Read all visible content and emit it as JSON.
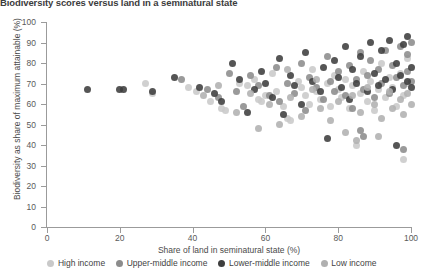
{
  "chart_data": {
    "type": "scatter",
    "title": "Biodiversity scores versus land in a seminatural state",
    "xlabel": "Share of land in seminatural state (%)",
    "ylabel": "Biodiversity as share of maximum attainable (%)",
    "xlim": [
      0,
      100
    ],
    "ylim": [
      0,
      100
    ],
    "xticks": [
      0,
      20,
      40,
      60,
      80,
      100
    ],
    "yticks": [
      0,
      10,
      20,
      30,
      40,
      50,
      60,
      70,
      80,
      90,
      100
    ],
    "grid": false,
    "legend_position": "bottom",
    "series": [
      {
        "name": "High income",
        "color": "#c9c9c9",
        "points": [
          [
            27,
            70
          ],
          [
            29,
            65
          ],
          [
            39,
            68
          ],
          [
            41,
            66
          ],
          [
            45,
            61
          ],
          [
            48,
            58
          ],
          [
            49,
            57
          ],
          [
            53,
            70
          ],
          [
            55,
            69
          ],
          [
            57,
            72
          ],
          [
            58,
            62
          ],
          [
            59,
            61
          ],
          [
            60,
            64
          ],
          [
            62,
            75
          ],
          [
            63,
            66
          ],
          [
            65,
            59
          ],
          [
            66,
            53
          ],
          [
            67,
            52
          ],
          [
            69,
            71
          ],
          [
            70,
            68
          ],
          [
            71,
            64
          ],
          [
            72,
            60
          ],
          [
            73,
            77
          ],
          [
            74,
            66
          ],
          [
            75,
            62
          ],
          [
            77,
            70
          ],
          [
            78,
            59
          ],
          [
            79,
            74
          ],
          [
            80,
            67
          ],
          [
            81,
            63
          ],
          [
            82,
            72
          ],
          [
            83,
            58
          ],
          [
            84,
            69
          ],
          [
            85,
            40
          ],
          [
            86,
            65
          ],
          [
            87,
            76
          ],
          [
            88,
            61
          ],
          [
            89,
            71
          ],
          [
            90,
            57
          ],
          [
            91,
            67
          ],
          [
            92,
            80
          ],
          [
            93,
            63
          ],
          [
            94,
            73
          ],
          [
            95,
            68
          ],
          [
            96,
            59
          ],
          [
            97,
            75
          ],
          [
            98,
            33
          ],
          [
            98,
            64
          ],
          [
            99,
            70
          ],
          [
            99,
            82
          ]
        ]
      },
      {
        "name": "Upper-middle income",
        "color": "#8c8c8c",
        "points": [
          [
            37,
            72
          ],
          [
            44,
            67
          ],
          [
            47,
            63
          ],
          [
            50,
            75
          ],
          [
            52,
            66
          ],
          [
            54,
            59
          ],
          [
            56,
            74
          ],
          [
            58,
            69
          ],
          [
            61,
            64
          ],
          [
            63,
            78
          ],
          [
            64,
            61
          ],
          [
            66,
            70
          ],
          [
            68,
            65
          ],
          [
            70,
            80
          ],
          [
            71,
            57
          ],
          [
            72,
            73
          ],
          [
            74,
            68
          ],
          [
            76,
            62
          ],
          [
            77,
            83
          ],
          [
            78,
            71
          ],
          [
            79,
            66
          ],
          [
            80,
            76
          ],
          [
            82,
            64
          ],
          [
            83,
            79
          ],
          [
            84,
            58
          ],
          [
            85,
            72
          ],
          [
            86,
            85
          ],
          [
            87,
            67
          ],
          [
            88,
            74
          ],
          [
            89,
            81
          ],
          [
            90,
            63
          ],
          [
            91,
            77
          ],
          [
            92,
            70
          ],
          [
            93,
            86
          ],
          [
            94,
            65
          ],
          [
            95,
            79
          ],
          [
            96,
            73
          ],
          [
            97,
            88
          ],
          [
            98,
            69
          ],
          [
            98,
            38
          ],
          [
            99,
            84
          ],
          [
            99,
            76
          ],
          [
            100,
            90
          ],
          [
            100,
            71
          ],
          [
            86,
            47
          ],
          [
            87,
            44
          ]
        ]
      },
      {
        "name": "Lower-middle income",
        "color": "#3e3e3e",
        "points": [
          [
            11,
            67
          ],
          [
            20,
            67
          ],
          [
            21,
            67
          ],
          [
            29,
            66
          ],
          [
            35,
            73
          ],
          [
            42,
            68
          ],
          [
            46,
            65
          ],
          [
            48,
            61
          ],
          [
            51,
            80
          ],
          [
            53,
            72
          ],
          [
            55,
            56
          ],
          [
            57,
            67
          ],
          [
            59,
            76
          ],
          [
            60,
            70
          ],
          [
            62,
            63
          ],
          [
            64,
            82
          ],
          [
            65,
            55
          ],
          [
            67,
            74
          ],
          [
            68,
            69
          ],
          [
            70,
            60
          ],
          [
            71,
            85
          ],
          [
            73,
            71
          ],
          [
            75,
            66
          ],
          [
            76,
            78
          ],
          [
            77,
            43
          ],
          [
            79,
            81
          ],
          [
            80,
            73
          ],
          [
            81,
            68
          ],
          [
            82,
            88
          ],
          [
            83,
            62
          ],
          [
            84,
            77
          ],
          [
            85,
            70
          ],
          [
            86,
            83
          ],
          [
            88,
            66
          ],
          [
            89,
            90
          ],
          [
            90,
            75
          ],
          [
            91,
            69
          ],
          [
            92,
            86
          ],
          [
            93,
            72
          ],
          [
            94,
            91
          ],
          [
            95,
            67
          ],
          [
            96,
            80
          ],
          [
            97,
            74
          ],
          [
            98,
            89
          ],
          [
            99,
            71
          ],
          [
            99,
            93
          ],
          [
            100,
            78
          ],
          [
            100,
            68
          ],
          [
            96,
            40
          ]
        ]
      },
      {
        "name": "Low income",
        "color": "#b0b0b0",
        "points": [
          [
            43,
            64
          ],
          [
            47,
            69
          ],
          [
            52,
            56
          ],
          [
            56,
            65
          ],
          [
            58,
            48
          ],
          [
            61,
            60
          ],
          [
            64,
            50
          ],
          [
            67,
            63
          ],
          [
            70,
            54
          ],
          [
            73,
            67
          ],
          [
            75,
            58
          ],
          [
            78,
            52
          ],
          [
            80,
            61
          ],
          [
            82,
            46
          ],
          [
            84,
            64
          ],
          [
            86,
            56
          ],
          [
            88,
            68
          ],
          [
            90,
            60
          ],
          [
            92,
            53
          ],
          [
            94,
            66
          ],
          [
            95,
            58
          ],
          [
            97,
            62
          ],
          [
            98,
            55
          ],
          [
            99,
            65
          ],
          [
            100,
            60
          ],
          [
            85,
            42
          ],
          [
            91,
            44
          ],
          [
            74,
            72
          ],
          [
            66,
            77
          ]
        ]
      }
    ]
  },
  "legend": {
    "items": [
      {
        "label": "High income",
        "color": "#c9c9c9"
      },
      {
        "label": "Upper-middle income",
        "color": "#8c8c8c"
      },
      {
        "label": "Lower-middle income",
        "color": "#3e3e3e"
      },
      {
        "label": "Low income",
        "color": "#b0b0b0"
      }
    ]
  }
}
